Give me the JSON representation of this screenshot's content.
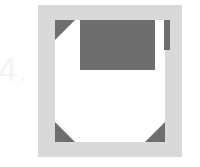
{
  "figure": {
    "caption": "4.",
    "caption_color": "#f4f4f5",
    "background_color": "#ffffff",
    "width": 200,
    "height": 167
  },
  "graphic": {
    "name": "floppy-disk-icon",
    "frame": {
      "label": "disk-frame",
      "color": "#d9d9d9"
    },
    "body": {
      "label": "disk-body",
      "color": "#ffffff"
    },
    "label_panel": {
      "label": "disk-label-panel",
      "color": "#6e6e6e"
    },
    "write_protect_tab": {
      "label": "write-protect-tab",
      "color": "#6e6e6e"
    },
    "corners": [
      {
        "label": "corner-top-left",
        "color": "#6e6e6e"
      },
      {
        "label": "corner-bottom-left",
        "color": "#6e6e6e"
      },
      {
        "label": "corner-bottom-right",
        "color": "#6e6e6e"
      }
    ]
  }
}
